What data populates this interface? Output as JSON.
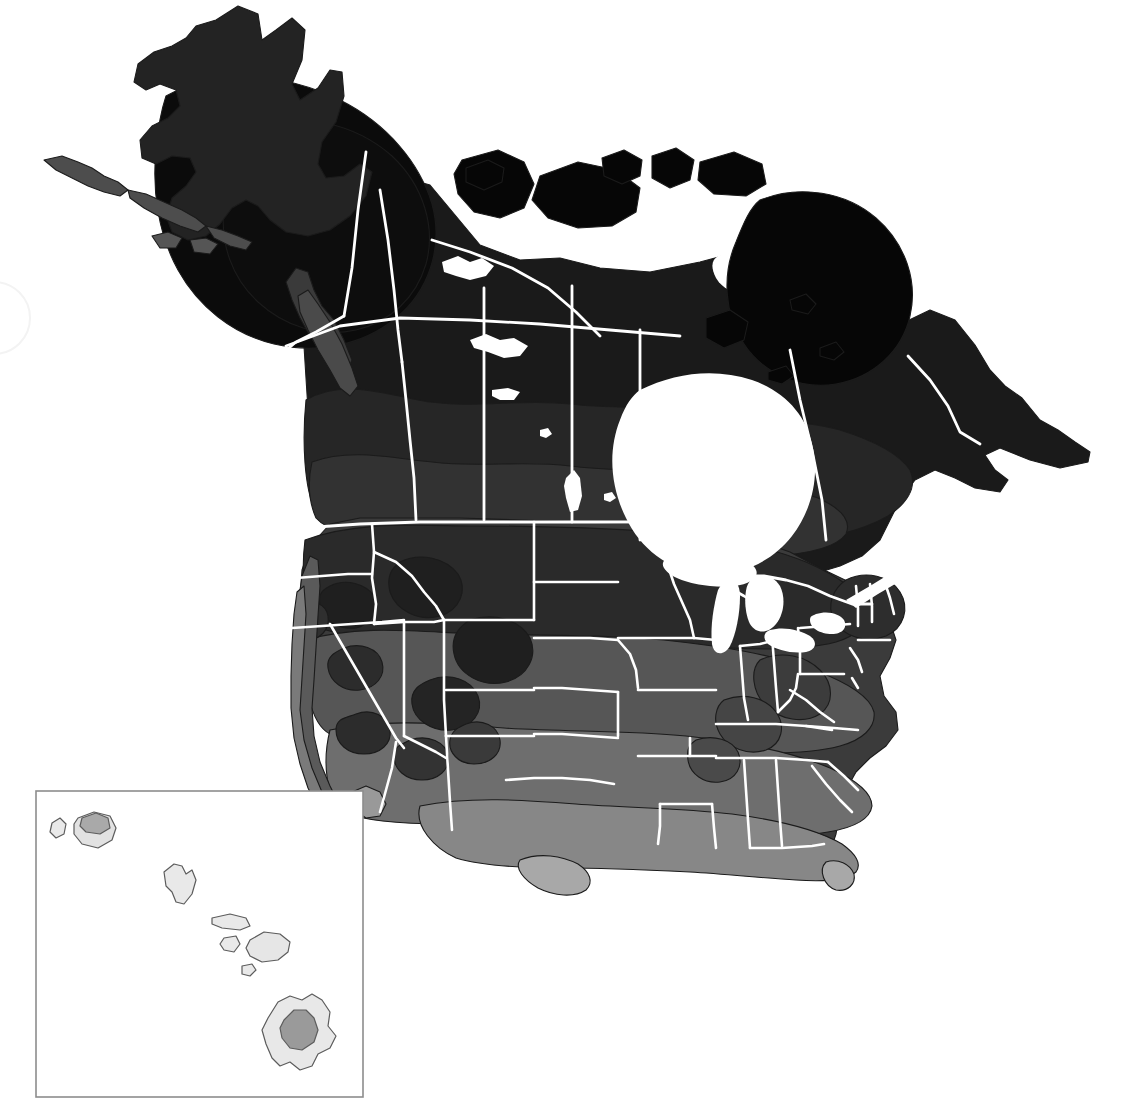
{
  "figure": {
    "kind": "thematic-choropleth-map",
    "title": "",
    "region": "North America",
    "projection": "conic",
    "background_color": "#ffffff",
    "outline_color": "#1b1b1b",
    "border_color": "#ffffff",
    "water_color": "#ffffff"
  },
  "palette": {
    "name": "grayscale-zone-ramp",
    "description": "Darkest = coldest zone, lightest = warmest zone",
    "steps": [
      {
        "id": "z1",
        "label": "Zone 1",
        "hex": "#0a0a0a"
      },
      {
        "id": "z2",
        "label": "Zone 2",
        "hex": "#151515"
      },
      {
        "id": "z3",
        "label": "Zone 3",
        "hex": "#242424"
      },
      {
        "id": "z4",
        "label": "Zone 4",
        "hex": "#2f2f2f"
      },
      {
        "id": "z5",
        "label": "Zone 5",
        "hex": "#3d3d3d"
      },
      {
        "id": "z6",
        "label": "Zone 6",
        "hex": "#4c4c4c"
      },
      {
        "id": "z7",
        "label": "Zone 7",
        "hex": "#5c5c5c"
      },
      {
        "id": "z8",
        "label": "Zone 8",
        "hex": "#6d6d6d"
      },
      {
        "id": "z9",
        "label": "Zone 9",
        "hex": "#7e7e7e"
      },
      {
        "id": "z10",
        "label": "Zone 10",
        "hex": "#909090"
      },
      {
        "id": "z11",
        "label": "Zone 11",
        "hex": "#a4a4a4"
      },
      {
        "id": "z12",
        "label": "Zone 12",
        "hex": "#bcbcbc"
      },
      {
        "id": "z13",
        "label": "Zone 13",
        "hex": "#d5d5d5"
      },
      {
        "id": "z14",
        "label": "Zone 14",
        "hex": "#e6e6e6"
      }
    ]
  },
  "main_map": {
    "name": "north-america-main-map",
    "countries": [
      "Canada",
      "United States"
    ],
    "water_bodies": [
      "Hudson Bay",
      "Great Bear Lake",
      "Great Slave Lake",
      "Lake Athabasca",
      "Lake Winnipeg",
      "Lake Superior",
      "Lake Michigan",
      "Lake Huron",
      "Lake Erie",
      "Lake Ontario",
      "Gulf of St. Lawrence"
    ]
  },
  "inset": {
    "name": "hawaii-inset",
    "label": "",
    "frame": {
      "x": 36,
      "y": 791,
      "width": 327,
      "height": 306
    },
    "islands": [
      "Niihau",
      "Kauai",
      "Oahu",
      "Molokai",
      "Lanai",
      "Maui",
      "Kahoolawe",
      "Hawaii"
    ]
  },
  "chart_data": {
    "type": "heatmap",
    "title": "",
    "xlabel": "",
    "ylabel": "",
    "legend_position": "none",
    "grid": false,
    "categories": [
      "Zone 1",
      "Zone 2",
      "Zone 3",
      "Zone 4",
      "Zone 5",
      "Zone 6",
      "Zone 7",
      "Zone 8",
      "Zone 9",
      "Zone 10",
      "Zone 11",
      "Zone 12",
      "Zone 13",
      "Zone 14"
    ],
    "values": [
      1,
      2,
      3,
      4,
      5,
      6,
      7,
      8,
      9,
      10,
      11,
      12,
      13,
      14
    ],
    "colors": [
      "#0a0a0a",
      "#151515",
      "#242424",
      "#2f2f2f",
      "#3d3d3d",
      "#4c4c4c",
      "#5c5c5c",
      "#6d6d6d",
      "#7e7e7e",
      "#909090",
      "#a4a4a4",
      "#bcbcbc",
      "#d5d5d5",
      "#e6e6e6"
    ]
  }
}
